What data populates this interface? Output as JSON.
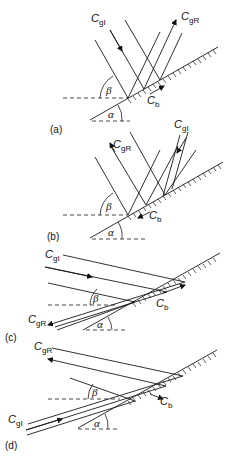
{
  "figure": {
    "symbols": {
      "incident": {
        "base": "C",
        "sub": "gI"
      },
      "reflected": {
        "base": "C",
        "sub": "gR"
      },
      "boundary": {
        "base": "C",
        "sub": "b"
      },
      "slope_angle": "α",
      "ray_angle": "β"
    },
    "panels": [
      {
        "id": "a",
        "label": "(a)"
      },
      {
        "id": "b",
        "label": "(b)"
      },
      {
        "id": "c",
        "label": "(c)"
      },
      {
        "id": "d",
        "label": "(d)"
      }
    ]
  }
}
